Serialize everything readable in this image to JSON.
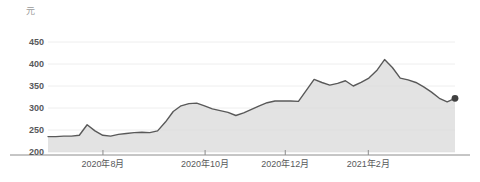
{
  "chart_data": {
    "type": "area",
    "title": "",
    "subtitle": "",
    "unit_label": "元",
    "xlabel": "",
    "ylabel": "",
    "ylim": [
      200,
      450
    ],
    "y_ticks": [
      200,
      250,
      300,
      350,
      400,
      450
    ],
    "y_tick_labels": [
      "200",
      "250",
      "300",
      "350",
      "400",
      "450"
    ],
    "x_tick_labels": [
      "2020年8月",
      "2020年10月",
      "2020年12月",
      "2021年2月"
    ],
    "grid": true,
    "legend": "none",
    "line_color": "#595959",
    "area_fill_color": "#d9d9d9",
    "grid_color": "#eeeeee",
    "axis_color": "#8c8c8c",
    "marker_color": "#404040",
    "last_value": 322,
    "series": [
      {
        "name": "价格",
        "values": [
          235,
          235,
          236,
          236,
          238,
          262,
          248,
          238,
          236,
          240,
          242,
          244,
          245,
          244,
          248,
          268,
          292,
          305,
          310,
          311,
          305,
          298,
          294,
          290,
          283,
          289,
          297,
          305,
          312,
          316,
          316,
          316,
          315,
          340,
          365,
          358,
          352,
          356,
          362,
          350,
          358,
          368,
          385,
          410,
          392,
          368,
          364,
          358,
          348,
          336,
          322,
          314,
          322
        ]
      }
    ],
    "x_tick_fractions": [
      0.135,
      0.386,
      0.583,
      0.787
    ]
  }
}
